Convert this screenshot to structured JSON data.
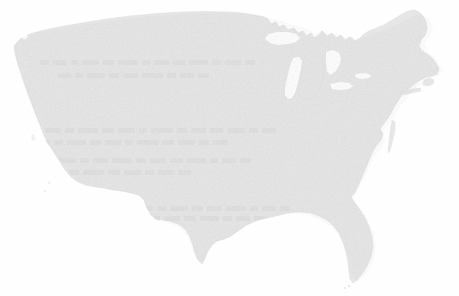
{
  "image": {
    "width": 459,
    "height": 296,
    "background_color": "#ffffff",
    "kind": "map"
  },
  "map": {
    "title": "",
    "subject": "Contiguous United States",
    "projection_look": "albers-like",
    "land_fill_color": "#e7e7e7",
    "land_edge_color": "#dedede",
    "water_cutout_color": "#ffffff",
    "has_labels": false,
    "has_state_borders": false,
    "has_legend": false,
    "has_graticule": false,
    "notable_features": [
      "northern border with Canada",
      "Great Lakes water cutouts",
      "Michigan Lower Peninsula",
      "Florida peninsula",
      "Gulf of Mexico coast",
      "Texas",
      "Pacific coast of California",
      "Maine and Cape Cod",
      "Chesapeake Bay and Delmarva Peninsula"
    ],
    "bounds_px": {
      "left": 12,
      "top": 8,
      "right": 445,
      "bottom": 285
    }
  },
  "artifacts": {
    "description": "Faint illegible ghost text bands and paper grain visible through the landmass fill",
    "ghost_text_bands_y": [
      62,
      131,
      163,
      208,
      238
    ],
    "grain_opacity": 0.55,
    "text_legible": false
  }
}
